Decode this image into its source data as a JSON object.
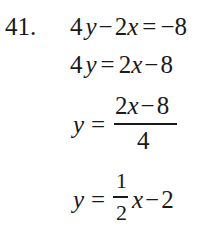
{
  "problem_number": "41.",
  "lines": [
    {
      "lhs_coef": "4",
      "lhs_var": "y",
      "op1": "−",
      "term_coef": "2",
      "term_var": "x",
      "eq": "=",
      "rhs": "−8"
    },
    {
      "lhs_coef": "4",
      "lhs_var": "y",
      "eq": "=",
      "rhs_coef": "2",
      "rhs_var": "x",
      "op": "−",
      "rhs_const": "8"
    },
    {
      "lhs_var": "y",
      "eq": "=",
      "numerator_coef": "2",
      "numerator_var": "x",
      "numerator_op": "−",
      "numerator_const": "8",
      "denominator": "4"
    },
    {
      "lhs_var": "y",
      "eq": "=",
      "frac_num": "1",
      "frac_den": "2",
      "var": "x",
      "op": "−",
      "const": "2"
    }
  ]
}
